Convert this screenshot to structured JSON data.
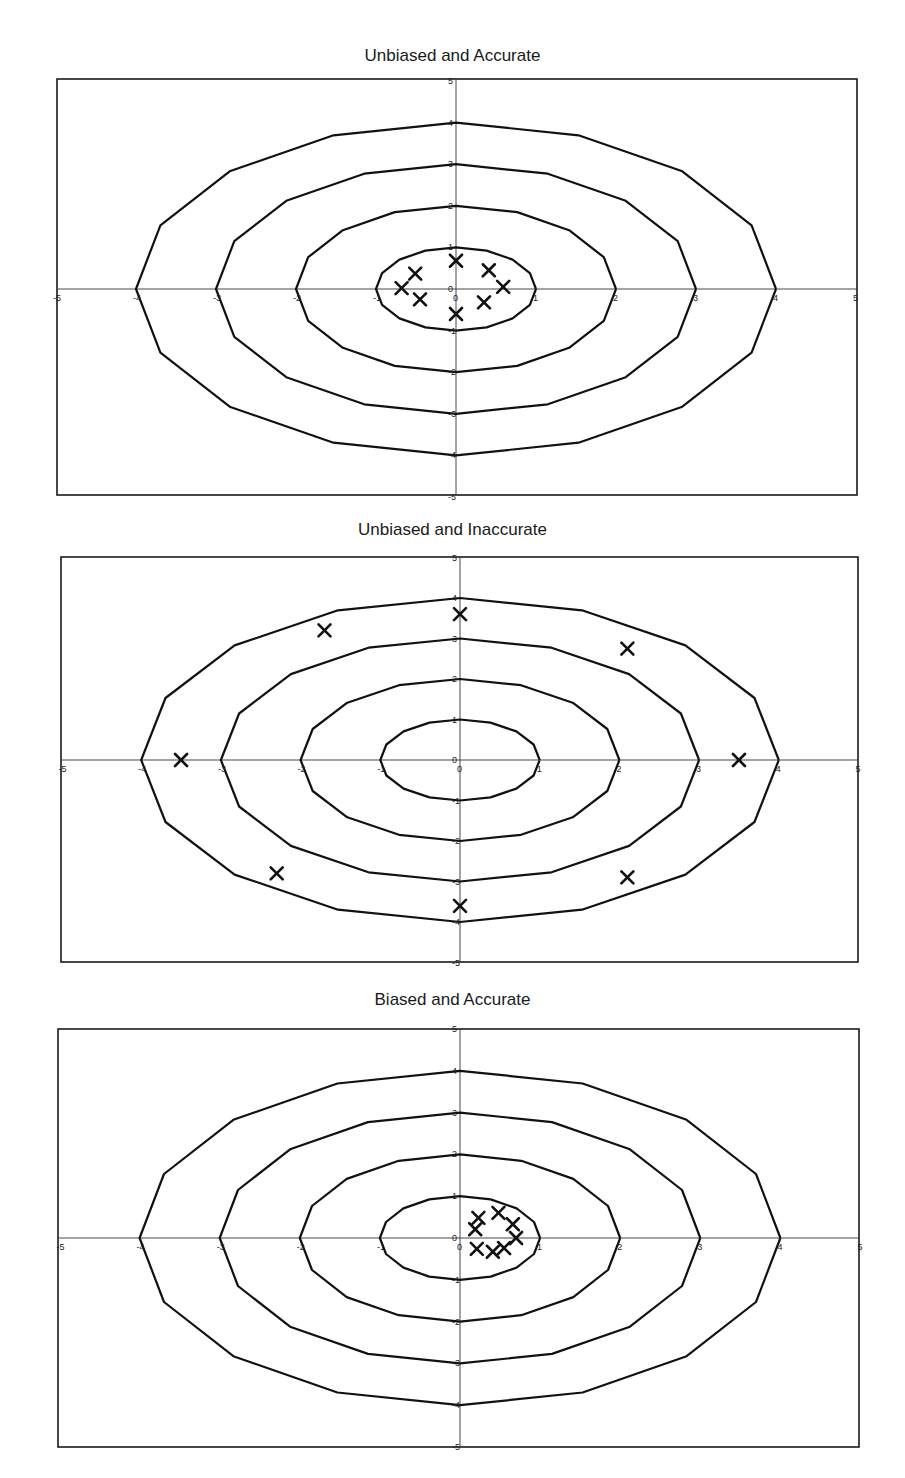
{
  "chart_data": [
    {
      "type": "scatter",
      "title": "Unbiased and Accurate",
      "xlabel": "",
      "ylabel": "",
      "xlim": [
        -5,
        5
      ],
      "ylim": [
        -5,
        5
      ],
      "xticks": [
        -5,
        -4,
        -3,
        -2,
        -1,
        0,
        1,
        2,
        3,
        4,
        5
      ],
      "yticks": [
        5,
        4,
        3,
        2,
        1,
        0,
        -1,
        -2,
        -3,
        -4,
        -5
      ],
      "grid": false,
      "contours": [
        1,
        2,
        3,
        4
      ],
      "marker": "x",
      "points": [
        {
          "x": -0.68,
          "y": 0.02
        },
        {
          "x": -0.51,
          "y": 0.37
        },
        {
          "x": -0.45,
          "y": -0.25
        },
        {
          "x": 0.0,
          "y": 0.68
        },
        {
          "x": 0.0,
          "y": -0.6
        },
        {
          "x": 0.41,
          "y": 0.45
        },
        {
          "x": 0.59,
          "y": 0.05
        },
        {
          "x": 0.35,
          "y": -0.32
        }
      ],
      "layout": {
        "top": 79,
        "bottom": 495,
        "left": 57,
        "right": 857,
        "ox": 456,
        "oy": 289,
        "title_y": 46
      }
    },
    {
      "type": "scatter",
      "title": "Unbiased and Inaccurate",
      "xlabel": "",
      "ylabel": "",
      "xlim": [
        -5,
        5
      ],
      "ylim": [
        -5,
        5
      ],
      "xticks": [
        -5,
        -4,
        -3,
        -2,
        -1,
        0,
        1,
        2,
        3,
        4,
        5
      ],
      "yticks": [
        5,
        4,
        3,
        2,
        1,
        0,
        -1,
        -2,
        -3,
        -4,
        -5
      ],
      "grid": false,
      "contours": [
        1,
        2,
        3,
        4
      ],
      "marker": "x",
      "points": [
        {
          "x": -3.5,
          "y": 0.0
        },
        {
          "x": -1.7,
          "y": 3.2
        },
        {
          "x": 0.0,
          "y": 3.6
        },
        {
          "x": 2.1,
          "y": 2.75
        },
        {
          "x": 3.5,
          "y": 0.0
        },
        {
          "x": 2.1,
          "y": -2.9
        },
        {
          "x": 0.0,
          "y": -3.6
        },
        {
          "x": -2.3,
          "y": -2.8
        }
      ],
      "layout": {
        "top": 557,
        "bottom": 962,
        "left": 61,
        "right": 858,
        "ox": 460,
        "oy": 760,
        "title_y": 520
      }
    },
    {
      "type": "scatter",
      "title": "Biased and Accurate",
      "xlabel": "",
      "ylabel": "",
      "xlim": [
        -5,
        5
      ],
      "ylim": [
        -5,
        5
      ],
      "xticks": [
        -5,
        -4,
        -3,
        -2,
        -1,
        0,
        1,
        2,
        3,
        4,
        5
      ],
      "yticks": [
        5,
        4,
        3,
        2,
        1,
        0,
        -1,
        -2,
        -3,
        -4,
        -5
      ],
      "grid": false,
      "contours": [
        1,
        2,
        3,
        4
      ],
      "marker": "x",
      "points": [
        {
          "x": 0.23,
          "y": 0.48
        },
        {
          "x": 0.19,
          "y": 0.21
        },
        {
          "x": 0.48,
          "y": 0.6
        },
        {
          "x": 0.66,
          "y": 0.33
        },
        {
          "x": 0.7,
          "y": 0.0
        },
        {
          "x": 0.55,
          "y": -0.24
        },
        {
          "x": 0.41,
          "y": -0.33
        },
        {
          "x": 0.21,
          "y": -0.26
        }
      ],
      "layout": {
        "top": 1029,
        "bottom": 1447,
        "left": 58,
        "right": 859,
        "ox": 460,
        "oy": 1238,
        "title_y": 990
      }
    }
  ]
}
